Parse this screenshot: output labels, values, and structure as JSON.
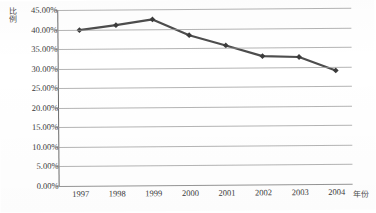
{
  "chart_data": {
    "type": "line",
    "title": "",
    "xlabel": "年份",
    "ylabel": "比例",
    "categories": [
      "1997",
      "1998",
      "1999",
      "2000",
      "2001",
      "2002",
      "2003",
      "2004"
    ],
    "values": [
      39.8,
      41.0,
      42.4,
      38.3,
      35.6,
      32.8,
      32.5,
      29.0
    ],
    "series": [
      {
        "name": "比例",
        "values": [
          39.8,
          41.0,
          42.4,
          38.3,
          35.6,
          32.8,
          32.5,
          29.0
        ]
      }
    ],
    "value_labels": [
      "39.80%",
      "41.00%",
      "42.40%",
      "38.30%",
      "35.60%",
      "32.80%",
      "32.50%",
      "29.00%"
    ],
    "ylim": [
      0,
      45
    ],
    "ytick_values": [
      0,
      5,
      10,
      15,
      20,
      25,
      30,
      35,
      40,
      45
    ],
    "ytick_labels": [
      "0.00%",
      "5.00%",
      "10.00%",
      "15.00%",
      "20.00%",
      "25.00%",
      "30.00%",
      "35.00%",
      "40.00%",
      "45.00%"
    ],
    "grid": true,
    "grid_axis": "y",
    "legend": false,
    "legend_position": "none",
    "marker": "diamond",
    "colors": {
      "line": "#4d4d4d",
      "marker": "#3b3b3b",
      "gridline": "#9b9b9b",
      "axis": "#6b6b6b",
      "text": "#3a3a3a",
      "background": "#ffffff"
    }
  }
}
